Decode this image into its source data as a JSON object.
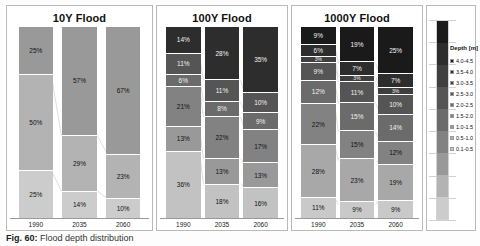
{
  "caption": {
    "figure_number": "Fig. 60:",
    "text": "Flood depth distribution"
  },
  "legend": {
    "title": "Depth [m]",
    "items": [
      {
        "label": "4.0-4.5",
        "color": "#1a1a1a"
      },
      {
        "label": "3.5-4.0",
        "color": "#2d2d2d"
      },
      {
        "label": "3.0-3.5",
        "color": "#3f3f3f"
      },
      {
        "label": "2.5-3.0",
        "color": "#555555"
      },
      {
        "label": "2.0-2.5",
        "color": "#6b6b6b"
      },
      {
        "label": "1.5-2.0",
        "color": "#828282"
      },
      {
        "label": "1.0-1.5",
        "color": "#999999"
      },
      {
        "label": "0.5-1.0",
        "color": "#b3b3b3"
      },
      {
        "label": "0.1-0.5",
        "color": "#cccccc"
      }
    ]
  },
  "chart_data": [
    {
      "type": "bar",
      "title": "10Y Flood",
      "stacked": true,
      "categories": [
        "1990",
        "2035",
        "2060"
      ],
      "xlabel": "",
      "ylabel": "",
      "ylim": [
        0,
        100
      ],
      "unit": "%",
      "series": [
        {
          "name": "1.0-1.5",
          "color": "#999999",
          "values": [
            25,
            57,
            67
          ]
        },
        {
          "name": "0.5-1.0",
          "color": "#b3b3b3",
          "values": [
            50,
            29,
            23
          ]
        },
        {
          "name": "0.1-0.5",
          "color": "#cccccc",
          "values": [
            25,
            14,
            10
          ]
        }
      ],
      "bars": [
        {
          "category": "1990",
          "segments": [
            {
              "label": "25%",
              "value": 25,
              "color": "#999999",
              "dark": false
            },
            {
              "label": "50%",
              "value": 50,
              "color": "#b3b3b3",
              "dark": false
            },
            {
              "label": "25%",
              "value": 25,
              "color": "#cccccc",
              "dark": false
            }
          ]
        },
        {
          "category": "2035",
          "segments": [
            {
              "label": "57%",
              "value": 57,
              "color": "#999999",
              "dark": false
            },
            {
              "label": "29%",
              "value": 29,
              "color": "#b3b3b3",
              "dark": false
            },
            {
              "label": "14%",
              "value": 14,
              "color": "#cccccc",
              "dark": false
            }
          ]
        },
        {
          "category": "2060",
          "segments": [
            {
              "label": "67%",
              "value": 67,
              "color": "#999999",
              "dark": false
            },
            {
              "label": "23%",
              "value": 23,
              "color": "#b3b3b3",
              "dark": false
            },
            {
              "label": "10%",
              "value": 10,
              "color": "#cccccc",
              "dark": false
            }
          ]
        }
      ]
    },
    {
      "type": "bar",
      "title": "100Y Flood",
      "stacked": true,
      "categories": [
        "1990",
        "2035",
        "2060"
      ],
      "xlabel": "",
      "ylabel": "",
      "ylim": [
        0,
        100
      ],
      "unit": "%",
      "series": [
        {
          "name": "3.0-3.5",
          "color": "#2d2d2d",
          "values": [
            14,
            28,
            35
          ]
        },
        {
          "name": "2.5-3.0",
          "color": "#555555",
          "values": [
            11,
            11,
            10
          ]
        },
        {
          "name": "2.0-2.5",
          "color": "#6b6b6b",
          "values": [
            6,
            8,
            9
          ]
        },
        {
          "name": "1.5-2.0",
          "color": "#828282",
          "values": [
            21,
            22,
            17
          ]
        },
        {
          "name": "1.0-1.5",
          "color": "#999999",
          "values": [
            13,
            13,
            13
          ]
        },
        {
          "name": "0.5-1.0",
          "color": "#c2c2c2",
          "values": [
            36,
            18,
            16
          ]
        }
      ],
      "bars": [
        {
          "category": "1990",
          "segments": [
            {
              "label": "14%",
              "value": 14,
              "color": "#2d2d2d",
              "dark": true
            },
            {
              "label": "11%",
              "value": 11,
              "color": "#555555",
              "dark": true
            },
            {
              "label": "6%",
              "value": 6,
              "color": "#6b6b6b",
              "dark": true
            },
            {
              "label": "21%",
              "value": 21,
              "color": "#828282",
              "dark": false
            },
            {
              "label": "13%",
              "value": 13,
              "color": "#999999",
              "dark": false
            },
            {
              "label": "36%",
              "value": 36,
              "color": "#c2c2c2",
              "dark": false
            }
          ]
        },
        {
          "category": "2035",
          "segments": [
            {
              "label": "28%",
              "value": 28,
              "color": "#2d2d2d",
              "dark": true
            },
            {
              "label": "11%",
              "value": 11,
              "color": "#555555",
              "dark": true
            },
            {
              "label": "8%",
              "value": 8,
              "color": "#6b6b6b",
              "dark": true
            },
            {
              "label": "22%",
              "value": 22,
              "color": "#828282",
              "dark": false
            },
            {
              "label": "13%",
              "value": 13,
              "color": "#999999",
              "dark": false
            },
            {
              "label": "18%",
              "value": 18,
              "color": "#c2c2c2",
              "dark": false
            }
          ]
        },
        {
          "category": "2060",
          "segments": [
            {
              "label": "35%",
              "value": 35,
              "color": "#2d2d2d",
              "dark": true
            },
            {
              "label": "10%",
              "value": 10,
              "color": "#555555",
              "dark": true
            },
            {
              "label": "9%",
              "value": 9,
              "color": "#6b6b6b",
              "dark": true
            },
            {
              "label": "17%",
              "value": 17,
              "color": "#828282",
              "dark": false
            },
            {
              "label": "13%",
              "value": 13,
              "color": "#999999",
              "dark": false
            },
            {
              "label": "16%",
              "value": 16,
              "color": "#c2c2c2",
              "dark": false
            }
          ]
        }
      ]
    },
    {
      "type": "bar",
      "title": "1000Y Flood",
      "stacked": true,
      "categories": [
        "1990",
        "2035",
        "2060"
      ],
      "xlabel": "",
      "ylabel": "",
      "ylim": [
        0,
        100
      ],
      "unit": "%",
      "series": [
        {
          "name": "4.0-4.5",
          "color": "#1a1a1a",
          "values": [
            9,
            19,
            25
          ]
        },
        {
          "name": "3.5-4.0",
          "color": "#2d2d2d",
          "values": [
            6,
            7,
            7
          ]
        },
        {
          "name": "3.0-3.5",
          "color": "#3f3f3f",
          "values": [
            3,
            3,
            3
          ]
        },
        {
          "name": "2.5-3.0",
          "color": "#555555",
          "values": [
            9,
            11,
            10
          ]
        },
        {
          "name": "2.0-2.5",
          "color": "#6b6b6b",
          "values": [
            12,
            15,
            14
          ]
        },
        {
          "name": "1.5-2.0",
          "color": "#828282",
          "values": [
            22,
            15,
            12
          ]
        },
        {
          "name": "1.0-1.5",
          "color": "#a8a8a8",
          "values": [
            28,
            23,
            19
          ]
        },
        {
          "name": "0.5-1.0",
          "color": "#c9c9c9",
          "values": [
            11,
            9,
            9
          ]
        }
      ],
      "bars": [
        {
          "category": "1990",
          "segments": [
            {
              "label": "9%",
              "value": 9,
              "color": "#1a1a1a",
              "dark": true
            },
            {
              "label": "6%",
              "value": 6,
              "color": "#2d2d2d",
              "dark": true
            },
            {
              "label": "3%",
              "value": 3,
              "color": "#3f3f3f",
              "dark": true
            },
            {
              "label": "9%",
              "value": 9,
              "color": "#555555",
              "dark": true
            },
            {
              "label": "12%",
              "value": 12,
              "color": "#6b6b6b",
              "dark": true
            },
            {
              "label": "22%",
              "value": 22,
              "color": "#828282",
              "dark": false
            },
            {
              "label": "28%",
              "value": 28,
              "color": "#a8a8a8",
              "dark": false
            },
            {
              "label": "11%",
              "value": 11,
              "color": "#c9c9c9",
              "dark": false
            }
          ]
        },
        {
          "category": "2035",
          "segments": [
            {
              "label": "19%",
              "value": 19,
              "color": "#1a1a1a",
              "dark": true
            },
            {
              "label": "7%",
              "value": 7,
              "color": "#2d2d2d",
              "dark": true
            },
            {
              "label": "3%",
              "value": 3,
              "color": "#3f3f3f",
              "dark": true
            },
            {
              "label": "11%",
              "value": 11,
              "color": "#555555",
              "dark": true
            },
            {
              "label": "15%",
              "value": 15,
              "color": "#6b6b6b",
              "dark": true
            },
            {
              "label": "15%",
              "value": 15,
              "color": "#828282",
              "dark": false
            },
            {
              "label": "23%",
              "value": 23,
              "color": "#a8a8a8",
              "dark": false
            },
            {
              "label": "9%",
              "value": 9,
              "color": "#c9c9c9",
              "dark": false
            }
          ]
        },
        {
          "category": "2060",
          "segments": [
            {
              "label": "25%",
              "value": 25,
              "color": "#1a1a1a",
              "dark": true
            },
            {
              "label": "7%",
              "value": 7,
              "color": "#2d2d2d",
              "dark": true
            },
            {
              "label": "3%",
              "value": 3,
              "color": "#3f3f3f",
              "dark": true
            },
            {
              "label": "10%",
              "value": 10,
              "color": "#555555",
              "dark": true
            },
            {
              "label": "14%",
              "value": 14,
              "color": "#6b6b6b",
              "dark": true
            },
            {
              "label": "12%",
              "value": 12,
              "color": "#828282",
              "dark": false
            },
            {
              "label": "19%",
              "value": 19,
              "color": "#a8a8a8",
              "dark": false
            },
            {
              "label": "9%",
              "value": 9,
              "color": "#c9c9c9",
              "dark": false
            }
          ]
        }
      ]
    }
  ]
}
